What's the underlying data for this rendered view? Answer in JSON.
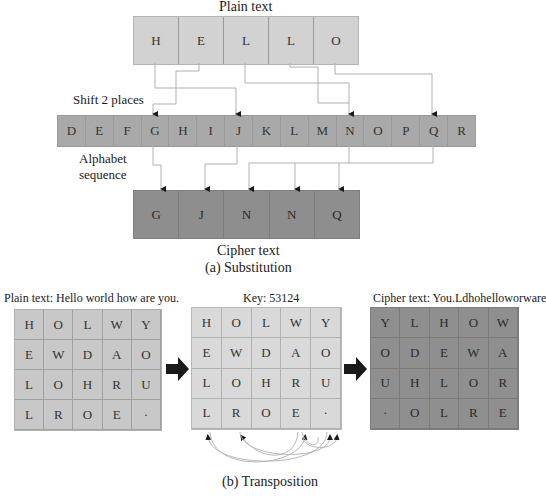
{
  "substitution": {
    "plain_label": "Plain text",
    "plain_letters": [
      "H",
      "E",
      "L",
      "L",
      "O"
    ],
    "shift_label": "Shift 2 places",
    "alphabet_letters": [
      "D",
      "E",
      "F",
      "G",
      "H",
      "I",
      "J",
      "K",
      "L",
      "M",
      "N",
      "O",
      "P",
      "Q",
      "R"
    ],
    "alphabet_label_line1": "Alphabet",
    "alphabet_label_line2": "sequence",
    "cipher_letters": [
      "G",
      "J",
      "N",
      "N",
      "Q"
    ],
    "cipher_label": "Cipher text",
    "caption": "(a) Substitution"
  },
  "transposition": {
    "plain_label": "Plain text: Hello world how are you.",
    "plain_grid": [
      [
        "H",
        "O",
        "L",
        "W",
        "Y"
      ],
      [
        "E",
        "W",
        "D",
        "A",
        "O"
      ],
      [
        "L",
        "O",
        "H",
        "R",
        "U"
      ],
      [
        "L",
        "R",
        "O",
        "E",
        "·"
      ]
    ],
    "key_label": "Key: 53124",
    "key_grid": [
      [
        "H",
        "O",
        "L",
        "W",
        "Y"
      ],
      [
        "E",
        "W",
        "D",
        "A",
        "O"
      ],
      [
        "L",
        "O",
        "H",
        "R",
        "U"
      ],
      [
        "L",
        "R",
        "O",
        "E",
        "·"
      ]
    ],
    "cipher_label": "Cipher text: You.Ldhohelloworware",
    "cipher_grid": [
      [
        "Y",
        "L",
        "H",
        "O",
        "W"
      ],
      [
        "O",
        "D",
        "E",
        "W",
        "A"
      ],
      [
        "U",
        "H",
        "L",
        "O",
        "R"
      ],
      [
        "·",
        "O",
        "L",
        "R",
        "E"
      ]
    ],
    "caption": "(b) Transposition"
  },
  "colors": {
    "plain": "#d2d2d2",
    "alphabet": "#a9a9a9",
    "cipher": "#8e8e8e",
    "key_grid": "#d9d9d9",
    "connector": "#b0b0b0",
    "arrow": "#1a1a1a"
  }
}
